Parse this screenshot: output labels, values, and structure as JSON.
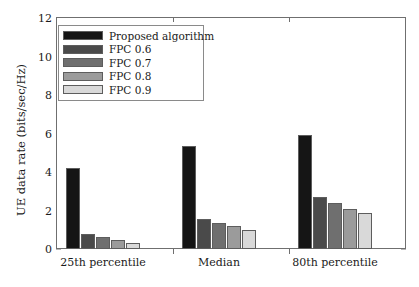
{
  "chart_data": {
    "type": "bar",
    "title": "",
    "xlabel": "",
    "ylabel": "UE data rate (bits/sec/Hz)",
    "categories": [
      "25th percentile",
      "Median",
      "80th percentile"
    ],
    "series": [
      {
        "name": "Proposed algorithm",
        "color": "#151515",
        "values": [
          4.2,
          5.35,
          5.9
        ]
      },
      {
        "name": "FPC 0.6",
        "color": "#4a4a4a",
        "values": [
          0.8,
          1.55,
          2.7
        ]
      },
      {
        "name": "FPC 0.7",
        "color": "#6f6f6f",
        "values": [
          0.62,
          1.35,
          2.4
        ]
      },
      {
        "name": "FPC 0.8",
        "color": "#9b9b9b",
        "values": [
          0.45,
          1.2,
          2.1
        ]
      },
      {
        "name": "FPC 0.9",
        "color": "#d9d9d9",
        "values": [
          0.3,
          0.98,
          1.85
        ]
      }
    ],
    "ylim": [
      0,
      12
    ],
    "yticks": [
      0,
      2,
      4,
      6,
      8,
      10,
      12
    ],
    "ytick_labels": [
      "0",
      "2",
      "4",
      "6",
      "8",
      "10",
      "12"
    ],
    "grid": false,
    "legend_position": "upper-left"
  },
  "axes": {
    "y_axis_label": "UE data rate (bits/sec/Hz)"
  }
}
